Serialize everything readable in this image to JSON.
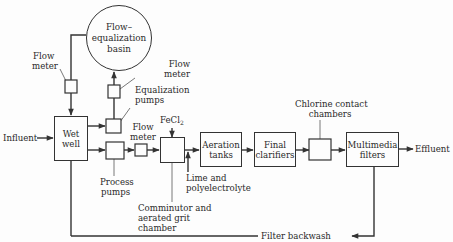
{
  "diagram": {
    "nodes": {
      "flow_equalization_basin": {
        "line1": "Flow–",
        "line2": "equalization",
        "line3": "basin"
      },
      "wet_well": {
        "line1": "Wet",
        "line2": "well"
      },
      "aeration_tanks": {
        "line1": "Aeration",
        "line2": "tanks"
      },
      "final_clarifiers": {
        "line1": "Final",
        "line2": "clarifiers"
      },
      "multimedia_filters": {
        "line1": "Multimedia",
        "line2": "filters"
      }
    },
    "labels": {
      "influent": "Influent",
      "effluent": "Effluent",
      "flow_meter_left": {
        "line1": "Flow",
        "line2": "meter"
      },
      "flow_meter_upper": {
        "line1": "Flow",
        "line2": "meter"
      },
      "flow_meter_mid": {
        "line1": "Flow",
        "line2": "meter"
      },
      "equalization_pumps": {
        "line1": "Equalization",
        "line2": "pumps"
      },
      "process_pumps": {
        "line1": "Process",
        "line2": "pumps"
      },
      "fecl2": {
        "base": "FeCl",
        "sub": "2"
      },
      "lime": {
        "line1": "Lime and",
        "line2": "polyelectrolyte"
      },
      "comminutor": {
        "line1": "Comminutor and",
        "line2": "aerated grit",
        "line3": "chamber"
      },
      "chlorine": {
        "line1": "Chlorine contact",
        "line2": "chambers"
      },
      "filter_backwash": "Filter backwash"
    },
    "colors": {
      "line": "#333333",
      "background": "#fdfdfd",
      "text": "#2a2a2a"
    }
  }
}
